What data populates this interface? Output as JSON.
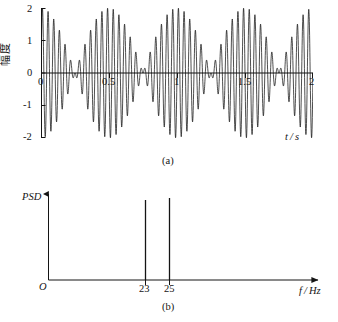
{
  "figure": {
    "panels": [
      {
        "id": "a",
        "caption": "(a)",
        "ylabel": "幅度",
        "xlabel": "t / s"
      },
      {
        "id": "b",
        "caption": "(b)",
        "ylabel": "PSD",
        "xlabel": "f / Hz",
        "origin_label": "O"
      }
    ]
  },
  "chart_data": [
    {
      "type": "line",
      "title": "",
      "subtitle": "",
      "panel": "(a)",
      "xlabel": "t / s",
      "ylabel": "幅度",
      "xlim": [
        0,
        2
      ],
      "ylim": [
        -2,
        2
      ],
      "xticks": [
        0,
        0.5,
        1,
        1.5,
        2
      ],
      "xtick_labels": [
        "0",
        "0.5",
        "1",
        "1.5",
        "2"
      ],
      "yticks": [
        -2,
        -1,
        0,
        1,
        2
      ],
      "ytick_labels": [
        "-2",
        "-1",
        "0",
        "1",
        "2"
      ],
      "grid": false,
      "legend": null,
      "description": "Beat waveform: sum of two unit-amplitude sinusoids at 23 Hz and 25 Hz over 0-2 s, giving a 2 Hz beat envelope with nodes every 0.5 s and peak amplitude 2.",
      "series": [
        {
          "name": "x(t) = sin(2π·23t) + sin(2π·25t)",
          "components": [
            {
              "frequency_hz": 23,
              "amplitude": 1
            },
            {
              "frequency_hz": 25,
              "amplitude": 1
            }
          ],
          "envelope_frequency_hz": 2,
          "peak_amplitude": 2,
          "node_times_s": [
            0.25,
            0.75,
            1.25,
            1.75
          ],
          "antinode_times_s": [
            0,
            0.5,
            1.0,
            1.5,
            2.0
          ],
          "sample_rate_hz": 1000
        }
      ]
    },
    {
      "type": "bar",
      "title": "",
      "panel": "(b)",
      "xlabel": "f / Hz",
      "ylabel": "PSD",
      "categories": [
        "23",
        "25"
      ],
      "values": [
        1,
        1
      ],
      "x": [
        23,
        25
      ],
      "xlim": [
        0,
        40
      ],
      "ylim": [
        0,
        1.15
      ],
      "xticks": [
        23,
        25
      ],
      "xtick_labels": [
        "23",
        "25"
      ],
      "yticks": [],
      "ytick_labels": [],
      "grid": false,
      "legend": null,
      "description": "Power spectral density of the beat signal: two sharp spectral lines of equal height at 23 Hz and 25 Hz."
    }
  ],
  "style": {
    "line_color": "#141414",
    "axis_color": "#141414",
    "background": "#ffffff"
  }
}
